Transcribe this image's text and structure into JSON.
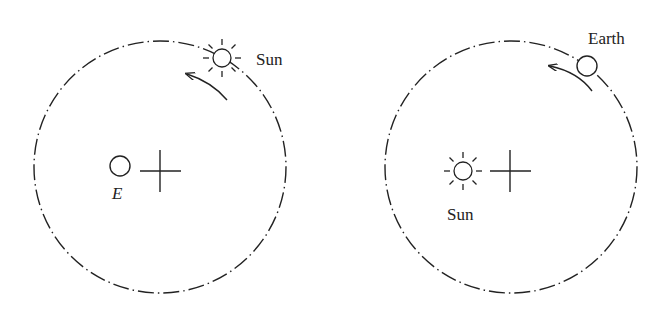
{
  "figure": {
    "left_panel": {
      "description": "Geocentric view: Sun orbits Earth",
      "orbit": {
        "cx": 160,
        "cy": 167,
        "r": 126,
        "style": "dash-dot"
      },
      "center_mark": {
        "x": 172,
        "y": 167
      },
      "central_body": {
        "label": "E",
        "x": 120,
        "y": 166,
        "icon": "earth-circle-icon"
      },
      "orbiting_body": {
        "label": "Sun",
        "x": 222,
        "y": 58,
        "icon": "sun-icon"
      },
      "motion_arrow": {
        "direction": "counterclockwise"
      }
    },
    "right_panel": {
      "description": "Heliocentric view: Earth orbits Sun",
      "orbit": {
        "cx": 511,
        "cy": 167,
        "r": 126,
        "style": "dash-dot"
      },
      "center_mark": {
        "x": 510,
        "y": 171
      },
      "central_body": {
        "label": "Sun",
        "x": 463,
        "y": 171,
        "icon": "sun-icon"
      },
      "orbiting_body": {
        "label": "Earth",
        "x": 587,
        "y": 66,
        "icon": "earth-circle-icon"
      },
      "motion_arrow": {
        "direction": "counterclockwise"
      }
    }
  },
  "colors": {
    "stroke": "#222222",
    "background": "#ffffff"
  }
}
